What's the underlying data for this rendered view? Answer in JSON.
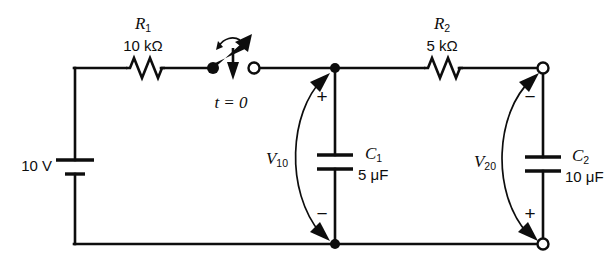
{
  "diagram": {
    "stroke_color": "#0d0d0d",
    "background_color": "#ffffff"
  },
  "source": {
    "value_label": "10 V",
    "symbol": "battery"
  },
  "switch": {
    "time_label": "t = 0",
    "state": "open",
    "symbol": "spst-switch"
  },
  "resistors": [
    {
      "name": "R1",
      "name_base": "R",
      "name_sub": "1",
      "value_label": "10 kΩ"
    },
    {
      "name": "R2",
      "name_base": "R",
      "name_sub": "2",
      "value_label": "5 kΩ"
    }
  ],
  "capacitors": [
    {
      "name": "C1",
      "name_base": "C",
      "name_sub": "1",
      "value_label": "5 μF"
    },
    {
      "name": "C2",
      "name_base": "C",
      "name_sub": "2",
      "value_label": "10 μF"
    }
  ],
  "voltages": [
    {
      "name": "V10",
      "name_base": "V",
      "name_sub": "10",
      "top_sign": "+",
      "bottom_sign": "−"
    },
    {
      "name": "V20",
      "name_base": "V",
      "name_sub": "20",
      "top_sign": "−",
      "bottom_sign": "+"
    }
  ]
}
